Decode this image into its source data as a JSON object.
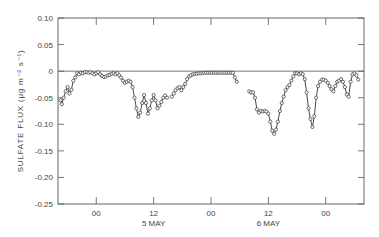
{
  "chart_data": {
    "type": "line",
    "title": "",
    "xlabel": "",
    "ylabel": "SULFATE FLUX (μg m⁻² s⁻¹)",
    "ylim": [
      -0.25,
      0.1
    ],
    "yticks": [
      0.1,
      0.05,
      0,
      -0.05,
      -0.1,
      -0.15,
      -0.2,
      -0.25
    ],
    "ytick_labels": [
      "0.10",
      "0.05",
      "0",
      "-0.05",
      "-0.10",
      "-0.15",
      "-0.20",
      "-0.25"
    ],
    "xticks": [
      {
        "label": "00",
        "sublabel": "",
        "hour": 0
      },
      {
        "label": "12",
        "sublabel": "5 MAY",
        "hour": 12
      },
      {
        "label": "00",
        "sublabel": "",
        "hour": 24
      },
      {
        "label": "12",
        "sublabel": "6 MAY",
        "hour": 36
      },
      {
        "label": "00",
        "sublabel": "",
        "hour": 48
      }
    ],
    "xlim_hours": [
      -8,
      56
    ],
    "zero_line": true,
    "grid": false,
    "marker": "open-circle",
    "series": [
      {
        "name": "sulfate flux",
        "segments": [
          {
            "x": [
              -7.5,
              -7.2,
              -6.8,
              -6.4,
              -6,
              -5.6,
              -5.2,
              -4.8,
              -4.4,
              -4,
              -3.6,
              -3.2,
              -2.8,
              -2.4,
              -2,
              -1.6,
              -1.2,
              -0.8,
              -0.4,
              0,
              0.4,
              0.8,
              1.2,
              1.6,
              2,
              2.4,
              2.8,
              3.2,
              3.6,
              4,
              4.4,
              4.8,
              5.2,
              5.6,
              6,
              6.4,
              6.8,
              7.2,
              7.6,
              8,
              8.4,
              8.8,
              9.2,
              9.6,
              10,
              10.4,
              10.8,
              11.2,
              11.6,
              12,
              12.4,
              12.8,
              13.2,
              13.6,
              14,
              14.4,
              14.8
            ],
            "y": [
              -0.055,
              -0.062,
              -0.05,
              -0.038,
              -0.03,
              -0.042,
              -0.035,
              -0.018,
              -0.012,
              -0.004,
              -0.006,
              -0.003,
              -0.004,
              -0.002,
              -0.002,
              -0.003,
              -0.002,
              -0.004,
              -0.006,
              -0.004,
              -0.002,
              -0.006,
              -0.009,
              -0.011,
              -0.01,
              -0.008,
              -0.007,
              -0.005,
              -0.004,
              -0.006,
              -0.004,
              -0.008,
              -0.012,
              -0.018,
              -0.022,
              -0.02,
              -0.018,
              -0.02,
              -0.03,
              -0.05,
              -0.07,
              -0.086,
              -0.078,
              -0.06,
              -0.045,
              -0.06,
              -0.08,
              -0.07,
              -0.055,
              -0.045,
              -0.055,
              -0.07,
              -0.065,
              -0.058,
              -0.05,
              -0.046,
              -0.05
            ]
          },
          {
            "x": [
              15.8,
              16.2,
              16.6,
              17,
              17.4,
              17.8,
              18.2,
              18.6,
              19,
              19.4,
              19.8,
              20.2,
              20.6,
              21,
              21.4,
              21.8,
              22.2,
              22.6,
              23,
              23.4,
              23.8,
              24.2,
              24.6,
              25,
              25.4,
              25.8,
              26.2,
              26.6,
              27,
              27.4,
              27.8,
              28.2,
              28.6,
              29,
              29.4
            ],
            "y": [
              -0.048,
              -0.042,
              -0.036,
              -0.032,
              -0.03,
              -0.036,
              -0.03,
              -0.024,
              -0.015,
              -0.01,
              -0.008,
              -0.006,
              -0.005,
              -0.005,
              -0.004,
              -0.004,
              -0.004,
              -0.003,
              -0.003,
              -0.003,
              -0.003,
              -0.003,
              -0.003,
              -0.003,
              -0.003,
              -0.003,
              -0.003,
              -0.003,
              -0.003,
              -0.003,
              -0.003,
              -0.003,
              -0.003,
              -0.012,
              -0.02
            ]
          },
          {
            "x": [
              32,
              32.4,
              32.8,
              33.2,
              33.6,
              34,
              34.4,
              34.8,
              35.2,
              35.6,
              36,
              36.4,
              36.8,
              37.2,
              37.6,
              38,
              38.4,
              38.8,
              39.2,
              39.6,
              40,
              40.4,
              40.8,
              41.2,
              41.6,
              42,
              42.4,
              42.8,
              43.2,
              43.6,
              44,
              44.4,
              44.8,
              45.2,
              45.6,
              46,
              46.4,
              46.8,
              47.2,
              47.6,
              48,
              48.4,
              48.8,
              49.2,
              49.6,
              50,
              50.4,
              50.8,
              51.2,
              51.6,
              52,
              52.4,
              52.8,
              53.2,
              53.6,
              54,
              54.4,
              54.8
            ],
            "y": [
              -0.038,
              -0.04,
              -0.04,
              -0.05,
              -0.072,
              -0.078,
              -0.075,
              -0.076,
              -0.075,
              -0.076,
              -0.08,
              -0.095,
              -0.112,
              -0.118,
              -0.11,
              -0.095,
              -0.075,
              -0.06,
              -0.048,
              -0.036,
              -0.03,
              -0.026,
              -0.018,
              -0.01,
              -0.004,
              -0.004,
              -0.006,
              -0.004,
              -0.006,
              -0.015,
              -0.04,
              -0.07,
              -0.09,
              -0.105,
              -0.085,
              -0.05,
              -0.028,
              -0.02,
              -0.016,
              -0.016,
              -0.018,
              -0.022,
              -0.028,
              -0.034,
              -0.038,
              -0.028,
              -0.02,
              -0.018,
              -0.015,
              -0.02,
              -0.03,
              -0.044,
              -0.048,
              -0.02,
              -0.006,
              -0.004,
              -0.008,
              -0.016
            ]
          }
        ]
      }
    ]
  }
}
